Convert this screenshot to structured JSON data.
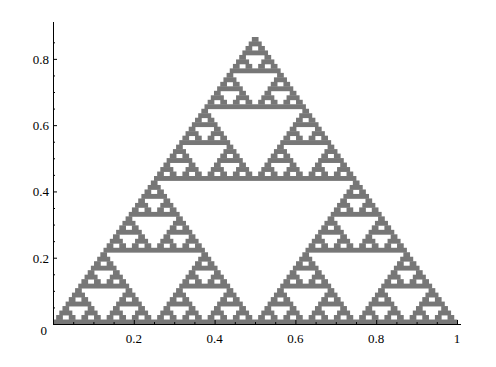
{
  "chart_data": {
    "type": "scatter",
    "title": "",
    "xlabel": "",
    "ylabel": "",
    "xlim": [
      0,
      1
    ],
    "ylim": [
      0,
      0.866
    ],
    "x_ticks": [
      "0.2",
      "0.4",
      "0.6",
      "0.8",
      "1"
    ],
    "y_ticks": [
      "0.2",
      "0.4",
      "0.6",
      "0.8"
    ],
    "origin_label": "0",
    "vertices": [
      [
        0,
        0
      ],
      [
        1,
        0
      ],
      [
        0.5,
        0.866
      ]
    ],
    "depth_rows": 64,
    "fill_color": "#777777",
    "grid": false,
    "legend": null
  }
}
